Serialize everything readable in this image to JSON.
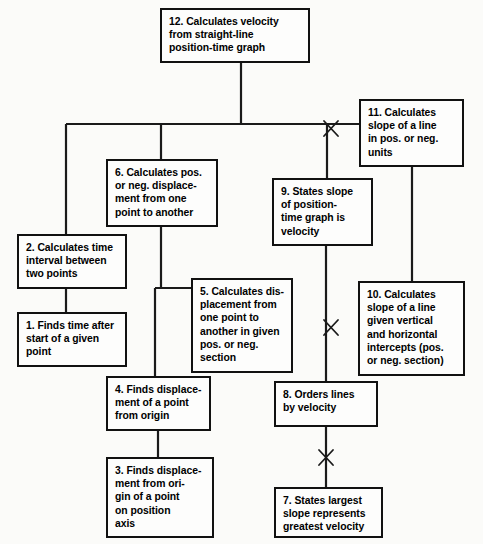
{
  "diagram": {
    "type": "flowchart",
    "orientation": "top-down",
    "canvas": {
      "width": 483,
      "height": 544
    },
    "style": {
      "background": "#fbfbf9",
      "box_fill": "#fdfdfc",
      "box_border": "#111111",
      "line_color": "#1a1a1a",
      "text_color": "#000000"
    },
    "nodes": [
      {
        "id": "n12",
        "number": "12",
        "label": "12. Calculates velocity\nfrom straight-line\nposition-time graph",
        "x": 160,
        "y": 8,
        "w": 150,
        "h": 55
      },
      {
        "id": "n11",
        "number": "11",
        "label": "11. Calculates\nslope of a line\nin pos. or neg.\nunits",
        "x": 359,
        "y": 99,
        "w": 105,
        "h": 68
      },
      {
        "id": "n6",
        "number": "6",
        "label": "6. Calculates pos.\nor neg. displace-\nment from one\npoint to another",
        "x": 106,
        "y": 159,
        "w": 112,
        "h": 68
      },
      {
        "id": "n9",
        "number": "9",
        "label": "9. States slope\nof position-\ntime graph is\nvelocity",
        "x": 272,
        "y": 178,
        "w": 101,
        "h": 68
      },
      {
        "id": "n2",
        "number": "2",
        "label": "2. Calculates time\ninterval between\ntwo points",
        "x": 17,
        "y": 234,
        "w": 110,
        "h": 55
      },
      {
        "id": "n5",
        "number": "5",
        "label": "5. Calculates dis-\nplacement from\none point to\nanother in given\npos. or neg.\nsection",
        "x": 191,
        "y": 278,
        "w": 102,
        "h": 95
      },
      {
        "id": "n10",
        "number": "10",
        "label": "10. Calculates\nslope of a line\ngiven vertical\nand horizontal\nintercepts (pos.\nor neg. section)",
        "x": 358,
        "y": 281,
        "w": 107,
        "h": 95
      },
      {
        "id": "n1",
        "number": "1",
        "label": "1. Finds time after\nstart of a given\npoint",
        "x": 17,
        "y": 312,
        "w": 110,
        "h": 55
      },
      {
        "id": "n4",
        "number": "4",
        "label": "4. Finds displace-\nment of a point\nfrom origin",
        "x": 106,
        "y": 376,
        "w": 105,
        "h": 55
      },
      {
        "id": "n8",
        "number": "8",
        "label": "8. Orders lines\nby velocity",
        "x": 274,
        "y": 381,
        "w": 104,
        "h": 46
      },
      {
        "id": "n3",
        "number": "3",
        "label": "3. Finds displace-\nment from ori-\ngin of a point\non position\naxis",
        "x": 106,
        "y": 457,
        "w": 108,
        "h": 81
      },
      {
        "id": "n7",
        "number": "7",
        "label": "7. States largest\nslope represents\ngreatest velocity",
        "x": 274,
        "y": 487,
        "w": 109,
        "h": 51
      }
    ],
    "edges": [
      {
        "id": "e12-bus",
        "from": "n12",
        "to": "bus",
        "kind": "trunk"
      },
      {
        "id": "e-bus-6",
        "from": "bus",
        "to": "n6",
        "kind": "branch"
      },
      {
        "id": "e-bus-2",
        "from": "bus",
        "to": "n2",
        "kind": "branch"
      },
      {
        "id": "e-bus-9",
        "from": "bus",
        "to": "n9",
        "kind": "branch"
      },
      {
        "id": "e-bus-11",
        "from": "bus",
        "to": "n11",
        "kind": "branch"
      },
      {
        "id": "e2-1",
        "from": "n2",
        "to": "n1",
        "kind": "vertical"
      },
      {
        "id": "e6-5",
        "from": "n6",
        "to": "n5",
        "kind": "branch"
      },
      {
        "id": "e6-4",
        "from": "n6",
        "to": "n4",
        "kind": "branch"
      },
      {
        "id": "e4-3",
        "from": "n4",
        "to": "n3",
        "kind": "vertical"
      },
      {
        "id": "e9-8",
        "from": "n9",
        "to": "n8",
        "kind": "vertical"
      },
      {
        "id": "e8-7",
        "from": "n8",
        "to": "n7",
        "kind": "vertical"
      },
      {
        "id": "e11-10",
        "from": "n11",
        "to": "n10",
        "kind": "vertical"
      }
    ],
    "crossing_markers": [
      {
        "id": "x1",
        "label": "line-crossing-marker",
        "x": 331,
        "y": 128
      },
      {
        "id": "x2",
        "label": "line-crossing-marker",
        "x": 331,
        "y": 327
      },
      {
        "id": "x3",
        "label": "line-crossing-marker",
        "x": 326,
        "y": 457
      }
    ]
  }
}
